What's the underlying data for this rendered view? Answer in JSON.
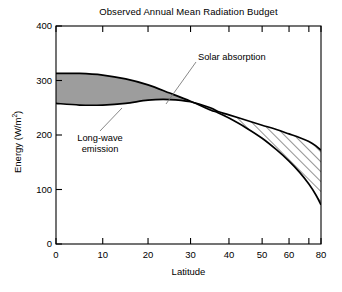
{
  "chart_data": {
    "type": "area",
    "title": "Observed Annual Mean Radiation Budget",
    "xlabel": "Latitude",
    "ylabel": "Energy (W/m²)",
    "ylabel_text": "Energy (W/m",
    "ylabel_sup": "2",
    "ylabel_tail": ")",
    "xscale": "sine-latitude",
    "xlim": [
      0,
      80
    ],
    "ylim": [
      0,
      400
    ],
    "grid": false,
    "legend": "none",
    "yticks": [
      0,
      100,
      200,
      300,
      400
    ],
    "ytick_labels": [
      "0",
      "100",
      "200",
      "300",
      "400"
    ],
    "xticks": [
      0,
      10,
      20,
      30,
      40,
      50,
      60,
      70,
      80
    ],
    "xtick_labels": [
      "0",
      "10",
      "20",
      "30",
      "40",
      "50",
      "60",
      "",
      "80"
    ],
    "x": [
      0,
      5,
      10,
      15,
      20,
      25,
      30,
      35,
      37,
      40,
      45,
      50,
      55,
      60,
      65,
      70,
      75,
      80
    ],
    "series": [
      {
        "name": "Solar absorption",
        "values": [
          313,
          313,
          310,
          303,
          292,
          277,
          262,
          246,
          241,
          231,
          213,
          194,
          173,
          152,
          131,
          110,
          90,
          72
        ]
      },
      {
        "name": "Long-wave emission",
        "values": [
          258,
          255,
          255,
          258,
          264,
          265,
          261,
          250,
          243,
          237,
          227,
          218,
          210,
          202,
          195,
          188,
          180,
          172
        ]
      }
    ],
    "regions": [
      {
        "name": "surplus",
        "label": "Solar absorption",
        "fill": "gray",
        "color": "#9d9d9d",
        "x_from": 0,
        "x_to": 37,
        "description": "Solar absorption exceeds long-wave emission (net radiative surplus)"
      },
      {
        "name": "deficit",
        "label": "Long-wave emission",
        "fill": "hatched",
        "color": "#ffffff",
        "x_from": 37,
        "x_to": 80,
        "description": "Long-wave emission exceeds solar absorption (net radiative deficit)"
      }
    ],
    "annotations": [
      {
        "name": "solar-absorption-annotation",
        "text": "Solar absorption",
        "points_to_x": 27,
        "points_to_y": 272
      },
      {
        "name": "long-wave-emission-annotation",
        "text_line1": "Long-wave",
        "text_line2": "emission",
        "points_to_x": 14,
        "points_to_y": 256
      }
    ],
    "crossover_latitude": 37,
    "crossover_energy": 242
  },
  "colors": {
    "axis": "#000000",
    "curve": "#000000",
    "shaded_region": "#9d9d9d",
    "hatch_line": "#000000",
    "background": "#ffffff",
    "leader_line": "#6d6d6d"
  }
}
